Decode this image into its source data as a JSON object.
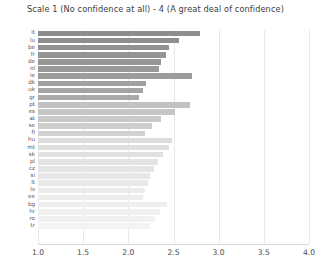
{
  "chart_data": {
    "type": "bar",
    "orientation": "horizontal",
    "title": "Scale 1 (No confidence at all) - 4 (A great deal of confidence)",
    "xlabel": "",
    "ylabel": "",
    "xlim": [
      1.0,
      4.0
    ],
    "xticks": [
      "1.0",
      "1.5",
      "2.0",
      "2.5",
      "3.0",
      "3.5",
      "4.0"
    ],
    "xtick_values": [
      1.0,
      1.5,
      2.0,
      2.5,
      3.0,
      3.5,
      4.0
    ],
    "grid": true,
    "grid_axis": "x",
    "legend": "none",
    "baseline": 1.0,
    "categories": [
      "it",
      "lu",
      "be",
      "fr",
      "de",
      "nl",
      "ie",
      "dk",
      "uk",
      "gr",
      "pt",
      "es",
      "at",
      "se",
      "fi",
      "hu",
      "mt",
      "sk",
      "pl",
      "cz",
      "si",
      "lt",
      "lv",
      "ee",
      "bg",
      "hr",
      "ro",
      "tr"
    ],
    "values": [
      2.79,
      2.56,
      2.45,
      2.42,
      2.36,
      2.34,
      2.7,
      2.2,
      2.16,
      2.12,
      2.68,
      2.52,
      2.36,
      2.26,
      2.18,
      2.48,
      2.45,
      2.38,
      2.33,
      2.28,
      2.24,
      2.22,
      2.18,
      2.16,
      2.43,
      2.35,
      2.3,
      2.24
    ],
    "bar_colors": [
      "#8d8d8d",
      "#8f8f8f",
      "#919191",
      "#949494",
      "#969696",
      "#999999",
      "#9c9c9c",
      "#a0a0a0",
      "#a4a4a4",
      "#a9a9a9",
      "#c2c2c2",
      "#c6c6c6",
      "#cacaca",
      "#cecece",
      "#d2d2d2",
      "#dcdcdc",
      "#dfdfdf",
      "#e1e1e1",
      "#e3e3e3",
      "#e5e5e5",
      "#e7e7e7",
      "#e9e9e9",
      "#ebebeb",
      "#ededed",
      "#eeeeee",
      "#f0f0f0",
      "#f1f1f1",
      "#f3f3f3"
    ]
  }
}
